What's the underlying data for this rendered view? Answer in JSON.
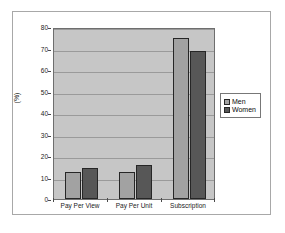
{
  "chart_data": {
    "type": "bar",
    "title": "",
    "xlabel": "",
    "ylabel": "(%)",
    "ylim": [
      0,
      80
    ],
    "ytick_step": 10,
    "yticks": [
      0,
      10,
      20,
      30,
      40,
      50,
      60,
      70,
      80
    ],
    "grid": true,
    "legend_position": "right",
    "categories": [
      "Pay Per View",
      "Pay Per Unit",
      "Subscription"
    ],
    "series": [
      {
        "name": "Men",
        "values": [
          12.5,
          12.5,
          75
        ],
        "color": "#a2a2a2"
      },
      {
        "name": "Women",
        "values": [
          14.5,
          16.0,
          69
        ],
        "color": "#575757"
      }
    ]
  },
  "colors": {
    "plot_background": "#c6c6c6",
    "gridline": "#9a9a9a",
    "axis": "#4a4a4a",
    "frame_border": "#a8a8a8",
    "bar_outline": "#262626",
    "page_background": "#ffffff"
  }
}
